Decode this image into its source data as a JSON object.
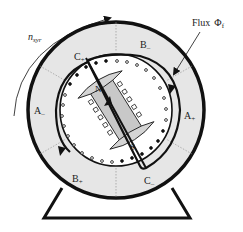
{
  "labels": {
    "speed": "n",
    "speed_sub": "syr",
    "flux": "Flux",
    "flux_symbol": "Φ",
    "flux_sub": "f",
    "north": "N",
    "south": "S",
    "phases": [
      {
        "id": "c-plus",
        "text": "C",
        "sign": "+"
      },
      {
        "id": "b-minus",
        "text": "B",
        "sign": "–"
      },
      {
        "id": "a-minus",
        "text": "A",
        "sign": "–"
      },
      {
        "id": "a-plus",
        "text": "A",
        "sign": "+"
      },
      {
        "id": "b-plus",
        "text": "B",
        "sign": "+"
      },
      {
        "id": "c-minus",
        "text": "C",
        "sign": "–"
      }
    ]
  },
  "colors": {
    "stroke": "#111111",
    "stator_fill": "#e6e6e6",
    "rotor_fill": "#c8c8c8",
    "pole_fill": "#d4d4d4",
    "background": "#ffffff"
  }
}
